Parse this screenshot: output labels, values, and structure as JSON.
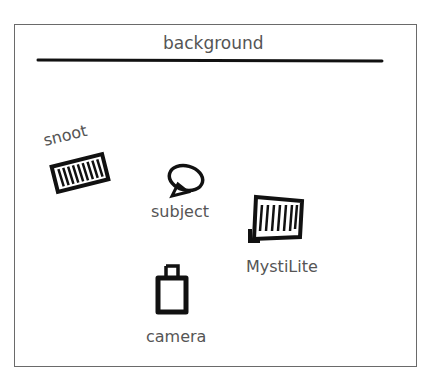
{
  "diagram": {
    "type": "lighting-setup",
    "background": {
      "label": "background"
    },
    "elements": [
      {
        "id": "snoot",
        "label": "snoot",
        "kind": "light-modifier"
      },
      {
        "id": "subject",
        "label": "subject",
        "kind": "subject"
      },
      {
        "id": "mystilite",
        "label": "MystiLite",
        "kind": "light"
      },
      {
        "id": "camera",
        "label": "camera",
        "kind": "camera"
      }
    ],
    "colors": {
      "ink": "#111111",
      "label": "#555555",
      "frame": "#6a6a6a"
    }
  }
}
